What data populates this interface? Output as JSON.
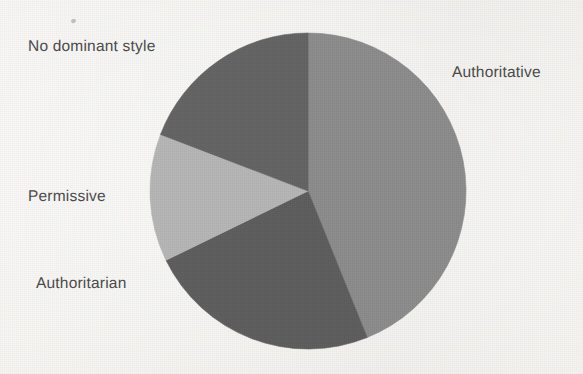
{
  "page": {
    "background_color": "#f4f3f0",
    "width": 583,
    "height": 374
  },
  "labels": {
    "no_dominant_style": "No dominant style",
    "authoritative": "Authoritative",
    "permissive": "Permissive",
    "authoritarian": "Authoritarian"
  },
  "chart_data": {
    "type": "pie",
    "title": "",
    "subtitle": "",
    "xlabel": "",
    "ylabel": "",
    "legend_position": "none",
    "labels_position": "outside-callout",
    "grid": false,
    "categories": [
      "Authoritative",
      "Authoritarian",
      "Permissive",
      "No dominant style"
    ],
    "values": [
      44,
      24,
      13,
      19
    ],
    "value_unit": "percent",
    "slices": [
      {
        "label": "Authoritative",
        "value": 44,
        "start_angle_deg": 0,
        "end_angle_deg": 158,
        "color": "#8b8b8b",
        "label_x": 452,
        "label_y": 64
      },
      {
        "label": "Authoritarian",
        "value": 24,
        "start_angle_deg": 158,
        "end_angle_deg": 244,
        "color": "#5d5d5d",
        "label_x": 36,
        "label_y": 275
      },
      {
        "label": "Permissive",
        "value": 13,
        "start_angle_deg": 244,
        "end_angle_deg": 291,
        "color": "#b5b5b5",
        "label_x": 28,
        "label_y": 188
      },
      {
        "label": "No dominant style",
        "value": 19,
        "start_angle_deg": 291,
        "end_angle_deg": 360,
        "color": "#636363",
        "label_x": 28,
        "label_y": 38
      }
    ],
    "geometry": {
      "center_x": 308,
      "center_y": 191,
      "radius": 158
    }
  }
}
